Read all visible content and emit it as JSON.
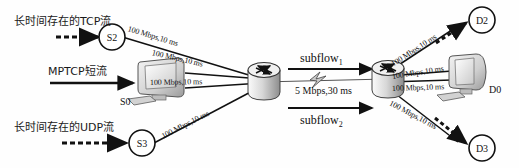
{
  "figure": {
    "type": "network-topology-diagram",
    "width": 519,
    "height": 168,
    "background_color": "#fefefe",
    "line_color": "#111111"
  },
  "flows": {
    "tcp": "长时间存在的TCP流",
    "mptcp": "MPTCP短流",
    "udp": "长时间存在的UDP流"
  },
  "nodes": {
    "s2": "S2",
    "s0": "S0",
    "s3": "S3",
    "d2": "D2",
    "d0": "D0",
    "d3": "D3"
  },
  "links": {
    "s2_router": "100 Mbps,10 ms",
    "s0_router_upper": "100 Mbps,10 ms",
    "s0_router_lower": "100 Mbps,10 ms",
    "s3_router": "100 Mbps,10 ms",
    "router_d2": "100 Mbps,10 ms",
    "router_d0_upper": "100 Mbps,10 ms",
    "router_d0_lower": "100 Mbps,10 ms",
    "router_d3": "100 Mbps,10 ms"
  },
  "bottleneck": {
    "subflow1_name": "subflow",
    "subflow1_index": "1",
    "subflow2_name": "subflow",
    "subflow2_index": "2",
    "capacity": "5 Mbps,30 ms"
  }
}
